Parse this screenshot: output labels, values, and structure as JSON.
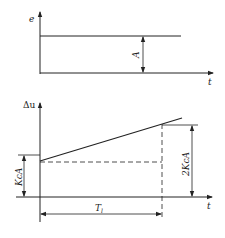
{
  "top_chart": {
    "y_axis_label": "e",
    "x_axis_label": "t",
    "amplitude_label": "A"
  },
  "bottom_chart": {
    "y_axis_label": "Δu",
    "x_axis_label": "t",
    "initial_offset_label": "KcA",
    "final_offset_label": "2KcA",
    "period_label": "T",
    "period_subscript": "l"
  },
  "colors": {
    "line": "#222222",
    "background": "#ffffff"
  }
}
